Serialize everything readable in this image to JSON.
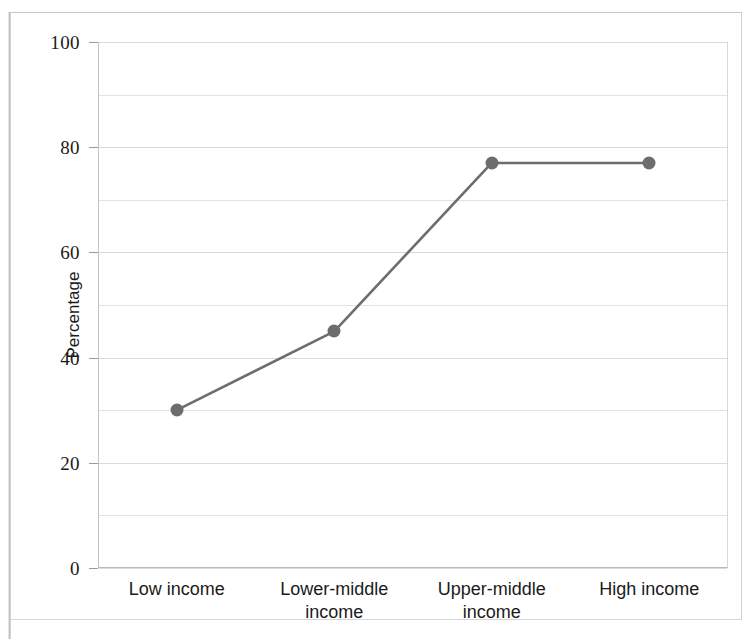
{
  "figure": {
    "background_color": "#ffffff",
    "frame_color": "#c8c8c8",
    "series_color": "#6d6d6d",
    "gridline_color": "#e2e2e2"
  },
  "chart_data": {
    "type": "line",
    "title": "",
    "subtitle": "",
    "xlabel": "",
    "ylabel": "Percentage",
    "categories": [
      "Low income",
      "Lower-middle income",
      "Upper-middle income",
      "High income"
    ],
    "category_lines": [
      [
        "Low income"
      ],
      [
        "Lower-middle",
        "income"
      ],
      [
        "Upper-middle",
        "income"
      ],
      [
        "High income"
      ]
    ],
    "values": [
      30,
      45,
      77,
      77
    ],
    "series": [
      {
        "name": "Percentage",
        "values": [
          30,
          45,
          77,
          77
        ],
        "color": "#6d6d6d",
        "marker": "circle"
      }
    ],
    "ylim": [
      0,
      100
    ],
    "y_major_ticks": [
      0,
      20,
      40,
      60,
      80,
      100
    ],
    "y_minor_gridlines": [
      10,
      30,
      50,
      70,
      90
    ],
    "y_tick_labels": [
      "0",
      "20",
      "40",
      "60",
      "80",
      "100"
    ],
    "grid": true,
    "grid_axis": "y",
    "legend": false,
    "legend_position": "none"
  },
  "axes": {
    "y": {
      "title": "Percentage",
      "ticks": [
        {
          "value": 100,
          "label": "100"
        },
        {
          "value": 80,
          "label": "80"
        },
        {
          "value": 60,
          "label": "60"
        },
        {
          "value": 40,
          "label": "40"
        },
        {
          "value": 20,
          "label": "20"
        },
        {
          "value": 0,
          "label": "0"
        }
      ]
    },
    "x": {
      "title": "",
      "ticks": [
        {
          "label": "Low income"
        },
        {
          "label": "Lower-middle income"
        },
        {
          "label": "Upper-middle income"
        },
        {
          "label": "High income"
        }
      ]
    }
  }
}
